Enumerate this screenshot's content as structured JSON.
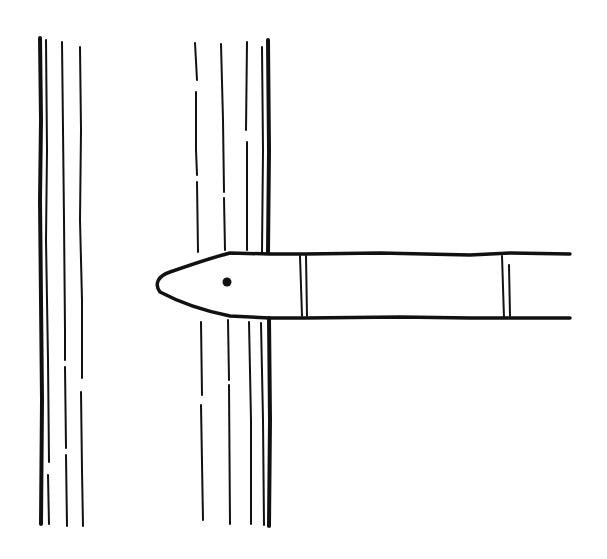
{
  "illustration": {
    "description": "Line drawing of a pencil-like object poking through between vertical lines",
    "ink_color": "#111111",
    "background_color": "#ffffff",
    "elements": {
      "left_post": "group of vertical lines",
      "right_post": "group of vertical lines interrupted by object",
      "object": "pencil-shaped object with pointed tip, eye dot and two bands"
    }
  }
}
